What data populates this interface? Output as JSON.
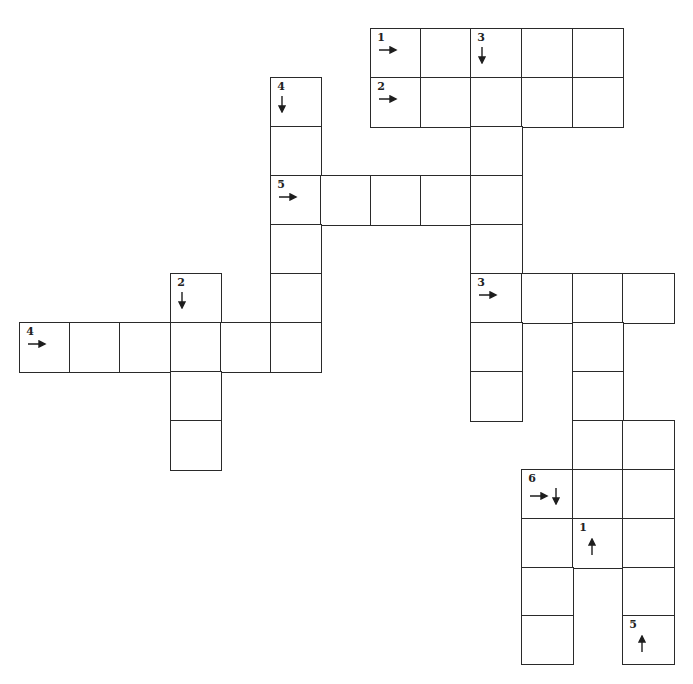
{
  "puzzle": {
    "type": "crossword-grid",
    "layout": {
      "x_lines": [
        20,
        70,
        120,
        171,
        221,
        271,
        321,
        371,
        421,
        471,
        522,
        573,
        623,
        674
      ],
      "y_lines": [
        29,
        78,
        127,
        176,
        225,
        274,
        323,
        372,
        421,
        470,
        519,
        568,
        616,
        664
      ],
      "line_color": "#2a2a2a",
      "background": "#ffffff"
    },
    "cells": [
      {
        "r": 0,
        "c": 7,
        "num": "1",
        "arrows": [
          "right"
        ]
      },
      {
        "r": 0,
        "c": 8
      },
      {
        "r": 0,
        "c": 9,
        "num": "3",
        "arrows": [
          "down"
        ]
      },
      {
        "r": 0,
        "c": 10
      },
      {
        "r": 0,
        "c": 11
      },
      {
        "r": 1,
        "c": 5,
        "num": "4",
        "arrows": [
          "down"
        ]
      },
      {
        "r": 1,
        "c": 7,
        "num": "2",
        "arrows": [
          "right"
        ]
      },
      {
        "r": 1,
        "c": 8
      },
      {
        "r": 1,
        "c": 9
      },
      {
        "r": 1,
        "c": 10
      },
      {
        "r": 1,
        "c": 11
      },
      {
        "r": 2,
        "c": 5
      },
      {
        "r": 2,
        "c": 9
      },
      {
        "r": 3,
        "c": 5,
        "num": "5",
        "arrows": [
          "right"
        ]
      },
      {
        "r": 3,
        "c": 6
      },
      {
        "r": 3,
        "c": 7
      },
      {
        "r": 3,
        "c": 8
      },
      {
        "r": 3,
        "c": 9
      },
      {
        "r": 4,
        "c": 5
      },
      {
        "r": 4,
        "c": 9
      },
      {
        "r": 5,
        "c": 3,
        "num": "2",
        "arrows": [
          "down"
        ]
      },
      {
        "r": 5,
        "c": 5
      },
      {
        "r": 5,
        "c": 9,
        "num": "3",
        "arrows": [
          "right"
        ]
      },
      {
        "r": 5,
        "c": 10
      },
      {
        "r": 5,
        "c": 11
      },
      {
        "r": 5,
        "c": 12
      },
      {
        "r": 6,
        "c": 0,
        "num": "4",
        "arrows": [
          "right"
        ]
      },
      {
        "r": 6,
        "c": 1
      },
      {
        "r": 6,
        "c": 2
      },
      {
        "r": 6,
        "c": 3
      },
      {
        "r": 6,
        "c": 4
      },
      {
        "r": 6,
        "c": 5
      },
      {
        "r": 6,
        "c": 9
      },
      {
        "r": 6,
        "c": 11
      },
      {
        "r": 7,
        "c": 3
      },
      {
        "r": 7,
        "c": 9
      },
      {
        "r": 7,
        "c": 11
      },
      {
        "r": 8,
        "c": 3
      },
      {
        "r": 8,
        "c": 11
      },
      {
        "r": 8,
        "c": 12
      },
      {
        "r": 9,
        "c": 10,
        "num": "6",
        "arrows": [
          "right",
          "down"
        ]
      },
      {
        "r": 9,
        "c": 11
      },
      {
        "r": 9,
        "c": 12
      },
      {
        "r": 10,
        "c": 10
      },
      {
        "r": 10,
        "c": 11,
        "num": "1",
        "arrows": [
          "up"
        ]
      },
      {
        "r": 10,
        "c": 12
      },
      {
        "r": 11,
        "c": 10
      },
      {
        "r": 11,
        "c": 12
      },
      {
        "r": 12,
        "c": 10
      },
      {
        "r": 12,
        "c": 12,
        "num": "5",
        "arrows": [
          "up"
        ]
      }
    ],
    "clue_starts": [
      {
        "num": "1",
        "direction": "across",
        "label": "1 →"
      },
      {
        "num": "2",
        "direction": "across",
        "label": "2 →"
      },
      {
        "num": "3",
        "direction": "down",
        "label": "3 ↓"
      },
      {
        "num": "4",
        "direction": "down",
        "label": "4 ↓"
      },
      {
        "num": "5",
        "direction": "across",
        "label": "5 →"
      },
      {
        "num": "2",
        "direction": "down",
        "label": "2 ↓"
      },
      {
        "num": "3",
        "direction": "across",
        "label": "3 →"
      },
      {
        "num": "4",
        "direction": "across",
        "label": "4 →"
      },
      {
        "num": "6",
        "direction": "across+down",
        "label": "6 → ↓"
      },
      {
        "num": "1",
        "direction": "up",
        "label": "1 ↑"
      },
      {
        "num": "5",
        "direction": "up",
        "label": "5 ↑"
      }
    ]
  }
}
